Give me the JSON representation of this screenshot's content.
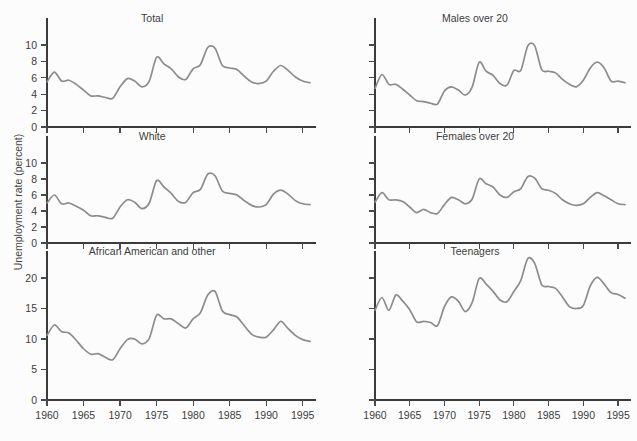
{
  "figure": {
    "ylabel": "Unemployment rate (percent)",
    "line_color": "#8c8c8c",
    "axis_color": "#3b3b3b",
    "background": "#fcfcfc"
  },
  "chart_data": {
    "type": "line",
    "title": "",
    "xlabel": "",
    "ylabel": "Unemployment rate (percent)",
    "grid": false,
    "legend": "none",
    "x": [
      1960,
      1961,
      1962,
      1963,
      1964,
      1965,
      1966,
      1967,
      1968,
      1969,
      1970,
      1971,
      1972,
      1973,
      1974,
      1975,
      1976,
      1977,
      1978,
      1979,
      1980,
      1981,
      1982,
      1983,
      1984,
      1985,
      1986,
      1987,
      1988,
      1989,
      1990,
      1991,
      1992,
      1993,
      1994,
      1995,
      1996
    ],
    "xlim": [
      1960,
      1996
    ],
    "xticks": [
      1960,
      1965,
      1970,
      1975,
      1980,
      1985,
      1990,
      1995
    ],
    "xticklabels": [
      "1960",
      "1965",
      "1970",
      "1975",
      "1980",
      "1985",
      "1990",
      "1995"
    ],
    "panels": [
      {
        "id": "total",
        "title": "Total",
        "row": 0,
        "col": 0,
        "ylim": [
          0,
          11.5
        ],
        "yticks": [
          0,
          2,
          4,
          6,
          8,
          10
        ],
        "yticklabels": [
          "0",
          "2",
          "4",
          "6",
          "8",
          "10"
        ],
        "show_ytick_labels": true,
        "values": [
          5.5,
          6.7,
          5.6,
          5.7,
          5.2,
          4.5,
          3.8,
          3.8,
          3.6,
          3.5,
          4.9,
          5.9,
          5.6,
          4.9,
          5.6,
          8.5,
          7.7,
          7.1,
          6.1,
          5.8,
          7.1,
          7.6,
          9.7,
          9.6,
          7.5,
          7.2,
          7.0,
          6.2,
          5.5,
          5.3,
          5.6,
          6.8,
          7.5,
          6.9,
          6.1,
          5.6,
          5.4
        ]
      },
      {
        "id": "males-over-20",
        "title": "Males over 20",
        "row": 0,
        "col": 1,
        "ylim": [
          0,
          11.5
        ],
        "yticks": [
          0,
          2,
          4,
          6,
          8,
          10
        ],
        "yticklabels": [
          "",
          "",
          "",
          "",
          "",
          ""
        ],
        "show_ytick_labels": false,
        "values": [
          4.7,
          6.4,
          5.2,
          5.2,
          4.6,
          3.9,
          3.2,
          3.1,
          2.9,
          2.8,
          4.4,
          4.9,
          4.5,
          3.9,
          4.9,
          7.9,
          6.8,
          6.3,
          5.3,
          5.1,
          6.9,
          6.9,
          9.9,
          9.9,
          7.0,
          6.8,
          6.6,
          5.8,
          5.2,
          4.9,
          5.7,
          7.2,
          7.9,
          7.2,
          5.6,
          5.6,
          5.4
        ]
      },
      {
        "id": "white",
        "title": "White",
        "row": 1,
        "col": 0,
        "ylim": [
          0,
          11.5
        ],
        "yticks": [
          0,
          2,
          4,
          6,
          8,
          10
        ],
        "yticklabels": [
          "0",
          "2",
          "4",
          "6",
          "8",
          "10"
        ],
        "show_ytick_labels": true,
        "values": [
          5.0,
          6.0,
          4.9,
          5.0,
          4.6,
          4.1,
          3.4,
          3.4,
          3.2,
          3.1,
          4.5,
          5.4,
          5.1,
          4.3,
          5.0,
          7.8,
          7.0,
          6.2,
          5.2,
          5.1,
          6.3,
          6.7,
          8.6,
          8.4,
          6.5,
          6.2,
          6.0,
          5.3,
          4.7,
          4.5,
          4.8,
          6.1,
          6.6,
          6.1,
          5.3,
          4.9,
          4.8
        ]
      },
      {
        "id": "females-over-20",
        "title": "Females over 20",
        "row": 1,
        "col": 1,
        "ylim": [
          0,
          11.5
        ],
        "yticks": [
          0,
          2,
          4,
          6,
          8,
          10
        ],
        "yticklabels": [
          "",
          "",
          "",
          "",
          "",
          ""
        ],
        "show_ytick_labels": false,
        "values": [
          5.1,
          6.3,
          5.4,
          5.4,
          5.2,
          4.5,
          3.8,
          4.2,
          3.8,
          3.7,
          4.8,
          5.7,
          5.4,
          4.9,
          5.5,
          8.0,
          7.4,
          7.0,
          6.0,
          5.7,
          6.4,
          6.8,
          8.3,
          8.1,
          6.8,
          6.6,
          6.2,
          5.4,
          4.9,
          4.7,
          4.9,
          5.7,
          6.3,
          5.9,
          5.4,
          4.9,
          4.8
        ]
      },
      {
        "id": "african-american-and-other",
        "title": "African American and other",
        "row": 2,
        "col": 0,
        "ylim": [
          0,
          25
        ],
        "yticks": [
          0,
          5,
          10,
          15,
          20
        ],
        "yticklabels": [
          "0",
          "5",
          "10",
          "15",
          "20"
        ],
        "show_ytick_labels": true,
        "values": [
          10.6,
          12.3,
          11.2,
          11.0,
          9.8,
          8.4,
          7.5,
          7.6,
          7.0,
          6.6,
          8.4,
          9.9,
          10.0,
          9.2,
          10.1,
          13.9,
          13.3,
          13.3,
          12.5,
          11.8,
          13.3,
          14.3,
          17.2,
          17.8,
          14.6,
          14.0,
          13.6,
          12.2,
          10.8,
          10.3,
          10.3,
          11.5,
          12.9,
          11.7,
          10.6,
          9.9,
          9.6
        ]
      },
      {
        "id": "teenagers",
        "title": "Teenagers",
        "row": 2,
        "col": 1,
        "ylim": [
          0,
          25
        ],
        "yticks": [
          0,
          5,
          10,
          15,
          20
        ],
        "yticklabels": [
          "",
          "",
          "",
          "",
          ""
        ],
        "show_ytick_labels": false,
        "values": [
          14.7,
          16.8,
          14.7,
          17.2,
          16.2,
          14.8,
          12.8,
          12.9,
          12.7,
          12.2,
          15.3,
          16.9,
          16.2,
          14.5,
          16.0,
          19.9,
          19.0,
          17.8,
          16.4,
          16.1,
          17.8,
          19.6,
          23.2,
          22.4,
          18.9,
          18.6,
          18.3,
          16.9,
          15.3,
          15.0,
          15.5,
          18.7,
          20.1,
          19.0,
          17.6,
          17.3,
          16.7
        ]
      }
    ]
  }
}
